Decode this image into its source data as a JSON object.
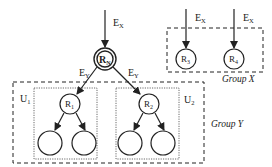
{
  "diagram": {
    "root_node": {
      "label": "R",
      "sub": "N"
    },
    "incoming_edge_label": {
      "label": "E",
      "sub": "X"
    },
    "group_x": {
      "label": "Group X",
      "nodes": [
        {
          "label": "R",
          "sub": "3",
          "edge": {
            "label": "E",
            "sub": "X"
          }
        },
        {
          "label": "R",
          "sub": "4",
          "edge": {
            "label": "E",
            "sub": "X"
          }
        }
      ]
    },
    "group_y": {
      "label": "Group Y",
      "units": [
        {
          "label": "U",
          "sub": "1",
          "node": {
            "label": "R",
            "sub": "1"
          },
          "edge": {
            "label": "E",
            "sub": "Y"
          },
          "children": 2
        },
        {
          "label": "U",
          "sub": "2",
          "node": {
            "label": "R",
            "sub": "2"
          },
          "edge": {
            "label": "E",
            "sub": "Y"
          },
          "children": 2
        }
      ]
    }
  }
}
